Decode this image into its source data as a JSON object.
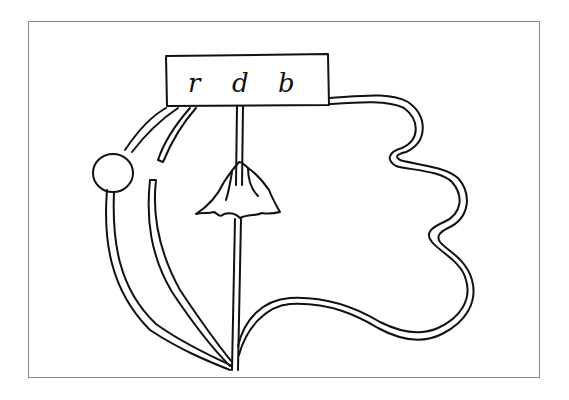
{
  "drawing": {
    "label": {
      "letters": [
        "r",
        "d",
        "b"
      ]
    },
    "colors": {
      "line": "#111111",
      "frame": "#8a8a8a",
      "background": "#ffffff"
    }
  }
}
